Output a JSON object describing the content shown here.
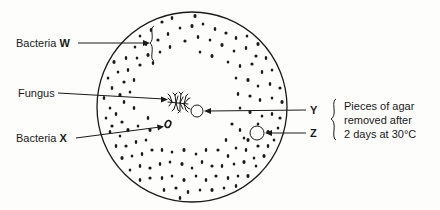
{
  "diagram": {
    "colors": {
      "ink": "#1a1a1a",
      "background": "#fdfdfc"
    },
    "plate": {
      "cx": 192,
      "cy": 107,
      "r": 95
    },
    "labels": {
      "bacteria_w_prefix": "Bacteria ",
      "bacteria_w_letter": "W",
      "fungus": "Fungus",
      "bacteria_x_prefix": "Bacteria ",
      "bacteria_x_letter": "X",
      "y": "Y",
      "z": "Z",
      "note_line1": "Pieces of agar",
      "note_line2": "removed after",
      "note_line3": "2 days at 30°C"
    },
    "hole_y": {
      "cx": 197,
      "cy": 111,
      "r": 6
    },
    "hole_z": {
      "cx": 257,
      "cy": 133,
      "r": 7
    },
    "colony_x": {
      "cx": 168,
      "cy": 124,
      "rx": 3,
      "ry": 4
    },
    "fungus_center": {
      "cx": 178,
      "cy": 103
    },
    "dots": [
      [
        130,
        28
      ],
      [
        140,
        36
      ],
      [
        151,
        30
      ],
      [
        162,
        22
      ],
      [
        172,
        18
      ],
      [
        183,
        15
      ],
      [
        195,
        16
      ],
      [
        206,
        14
      ],
      [
        218,
        17
      ],
      [
        229,
        20
      ],
      [
        240,
        24
      ],
      [
        252,
        28
      ],
      [
        262,
        34
      ],
      [
        135,
        47
      ],
      [
        146,
        44
      ],
      [
        158,
        40
      ],
      [
        168,
        34
      ],
      [
        180,
        28
      ],
      [
        192,
        26
      ],
      [
        203,
        24
      ],
      [
        215,
        29
      ],
      [
        226,
        33
      ],
      [
        236,
        38
      ],
      [
        247,
        36
      ],
      [
        258,
        44
      ],
      [
        268,
        42
      ],
      [
        276,
        50
      ],
      [
        120,
        48
      ],
      [
        126,
        58
      ],
      [
        137,
        58
      ],
      [
        148,
        55
      ],
      [
        160,
        52
      ],
      [
        170,
        47
      ],
      [
        185,
        41
      ],
      [
        198,
        37
      ],
      [
        210,
        40
      ],
      [
        222,
        45
      ],
      [
        234,
        51
      ],
      [
        246,
        48
      ],
      [
        256,
        56
      ],
      [
        266,
        58
      ],
      [
        278,
        62
      ],
      [
        114,
        62
      ],
      [
        118,
        72
      ],
      [
        128,
        70
      ],
      [
        140,
        65
      ],
      [
        153,
        63
      ],
      [
        200,
        52
      ],
      [
        212,
        56
      ],
      [
        228,
        62
      ],
      [
        240,
        66
      ],
      [
        252,
        64
      ],
      [
        262,
        72
      ],
      [
        272,
        70
      ],
      [
        282,
        74
      ],
      [
        108,
        78
      ],
      [
        112,
        88
      ],
      [
        124,
        82
      ],
      [
        134,
        80
      ],
      [
        236,
        78
      ],
      [
        248,
        80
      ],
      [
        258,
        86
      ],
      [
        270,
        84
      ],
      [
        280,
        88
      ],
      [
        104,
        98
      ],
      [
        110,
        108
      ],
      [
        120,
        95
      ],
      [
        130,
        92
      ],
      [
        238,
        94
      ],
      [
        250,
        96
      ],
      [
        260,
        100
      ],
      [
        272,
        98
      ],
      [
        282,
        102
      ],
      [
        106,
        118
      ],
      [
        116,
        114
      ],
      [
        122,
        122
      ],
      [
        134,
        108
      ],
      [
        240,
        108
      ],
      [
        250,
        112
      ],
      [
        262,
        116
      ],
      [
        272,
        114
      ],
      [
        280,
        118
      ],
      [
        110,
        132
      ],
      [
        120,
        136
      ],
      [
        128,
        130
      ],
      [
        138,
        126
      ],
      [
        148,
        118
      ],
      [
        232,
        124
      ],
      [
        240,
        130
      ],
      [
        244,
        138
      ],
      [
        268,
        132
      ],
      [
        278,
        128
      ],
      [
        116,
        146
      ],
      [
        126,
        146
      ],
      [
        136,
        142
      ],
      [
        146,
        140
      ],
      [
        150,
        130
      ],
      [
        236,
        148
      ],
      [
        246,
        150
      ],
      [
        258,
        146
      ],
      [
        268,
        146
      ],
      [
        274,
        140
      ],
      [
        122,
        158
      ],
      [
        132,
        156
      ],
      [
        142,
        154
      ],
      [
        152,
        150
      ],
      [
        162,
        150
      ],
      [
        172,
        152
      ],
      [
        184,
        150
      ],
      [
        196,
        154
      ],
      [
        206,
        150
      ],
      [
        218,
        150
      ],
      [
        228,
        156
      ],
      [
        254,
        158
      ],
      [
        264,
        156
      ],
      [
        130,
        170
      ],
      [
        140,
        166
      ],
      [
        150,
        168
      ],
      [
        160,
        164
      ],
      [
        170,
        162
      ],
      [
        182,
        164
      ],
      [
        192,
        168
      ],
      [
        202,
        162
      ],
      [
        212,
        166
      ],
      [
        222,
        166
      ],
      [
        234,
        164
      ],
      [
        244,
        162
      ],
      [
        256,
        166
      ],
      [
        140,
        180
      ],
      [
        150,
        178
      ],
      [
        162,
        178
      ],
      [
        172,
        176
      ],
      [
        184,
        180
      ],
      [
        196,
        176
      ],
      [
        206,
        180
      ],
      [
        216,
        176
      ],
      [
        228,
        178
      ],
      [
        238,
        176
      ],
      [
        248,
        176
      ],
      [
        152,
        190
      ],
      [
        164,
        190
      ],
      [
        176,
        188
      ],
      [
        188,
        192
      ],
      [
        200,
        190
      ],
      [
        212,
        190
      ],
      [
        224,
        188
      ],
      [
        236,
        186
      ],
      [
        168,
        198
      ],
      [
        180,
        198
      ],
      [
        194,
        200
      ],
      [
        206,
        198
      ],
      [
        218,
        196
      ],
      [
        124,
        102
      ],
      [
        112,
        126
      ],
      [
        226,
        140
      ],
      [
        258,
        124
      ],
      [
        248,
        140
      ]
    ]
  }
}
